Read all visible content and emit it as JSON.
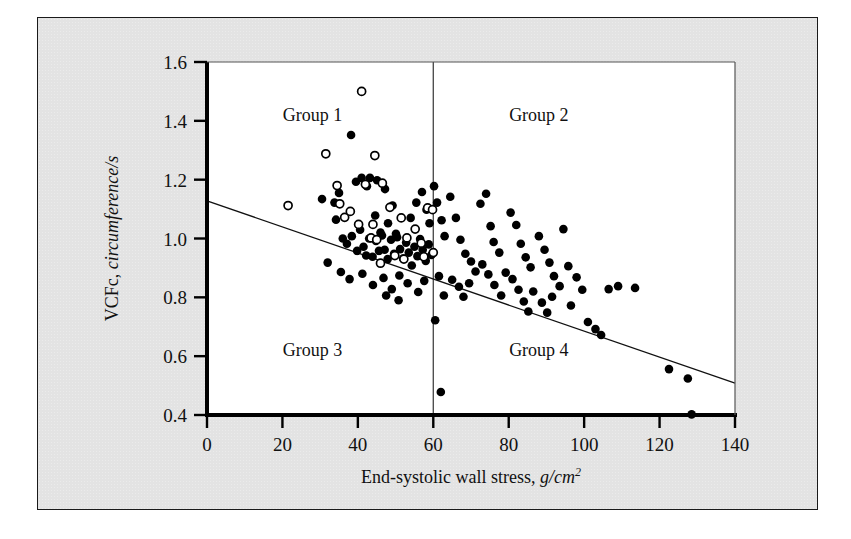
{
  "figure": {
    "background_color": "#e3e3e3",
    "plot_background_color": "#ffffff",
    "border_color": "#1a1a1a"
  },
  "chart_data": {
    "type": "scatter",
    "title": "",
    "xlabel": "End-systolic wall stress, g/cm",
    "xlabel_superscript": "2",
    "ylabel_roman": "VCFc, ",
    "ylabel_italic": "circumference/s",
    "xlim": [
      0,
      140
    ],
    "ylim": [
      0.4,
      1.6
    ],
    "xticks": [
      0,
      20,
      40,
      60,
      80,
      100,
      120,
      140
    ],
    "yticks": [
      0.4,
      0.6,
      0.8,
      1.0,
      1.2,
      1.4,
      1.6
    ],
    "xtick_labels": [
      "0",
      "20",
      "40",
      "60",
      "80",
      "100",
      "120",
      "140"
    ],
    "ytick_labels": [
      "0.4",
      "0.6",
      "0.8",
      "1.0",
      "1.2",
      "1.4",
      "1.6"
    ],
    "grid": false,
    "legend": false,
    "annotations": [
      {
        "text": "Group 1",
        "x": 28,
        "y": 1.4,
        "quadrant": "upper-left"
      },
      {
        "text": "Group 2",
        "x": 88,
        "y": 1.4,
        "quadrant": "upper-right"
      },
      {
        "text": "Group 3",
        "x": 28,
        "y": 0.6,
        "quadrant": "lower-left"
      },
      {
        "text": "Group 4",
        "x": 88,
        "y": 0.6,
        "quadrant": "lower-right"
      }
    ],
    "reference_lines": [
      {
        "name": "vertical-divider",
        "orientation": "vertical",
        "x": 60,
        "y_from": 0.4,
        "y_to": 1.6,
        "color": "#444444",
        "width": 1.3
      },
      {
        "name": "regression-line",
        "orientation": "diagonal",
        "x_from": 0,
        "y_from": 1.128,
        "x_to": 140,
        "y_to": 0.508,
        "color": "#111111",
        "width": 1.3
      }
    ],
    "series": [
      {
        "name": "filled-markers",
        "marker": "filled-circle",
        "color": "#000000",
        "points": [
          [
            30.5,
            1.134
          ],
          [
            33.8,
            1.122
          ],
          [
            35.0,
            1.155
          ],
          [
            38.2,
            1.352
          ],
          [
            39.5,
            1.193
          ],
          [
            41.0,
            1.206
          ],
          [
            42.4,
            1.178
          ],
          [
            43.2,
            1.206
          ],
          [
            44.6,
            1.078
          ],
          [
            45.1,
            1.198
          ],
          [
            46.0,
            1.02
          ],
          [
            47.2,
            1.168
          ],
          [
            48.0,
            1.052
          ],
          [
            49.2,
            1.112
          ],
          [
            50.1,
            1.016
          ],
          [
            34.2,
            1.064
          ],
          [
            36.0,
            1.0
          ],
          [
            37.1,
            0.982
          ],
          [
            38.4,
            1.008
          ],
          [
            39.8,
            0.958
          ],
          [
            40.6,
            1.03
          ],
          [
            41.5,
            0.972
          ],
          [
            42.2,
            0.942
          ],
          [
            43.0,
            1.0
          ],
          [
            43.9,
            0.938
          ],
          [
            44.8,
            0.992
          ],
          [
            45.6,
            0.958
          ],
          [
            46.4,
            1.01
          ],
          [
            47.1,
            0.962
          ],
          [
            47.9,
            0.93
          ],
          [
            48.8,
            0.996
          ],
          [
            49.6,
            0.948
          ],
          [
            50.4,
            1.004
          ],
          [
            51.2,
            0.964
          ],
          [
            52.0,
            0.932
          ],
          [
            52.8,
            0.986
          ],
          [
            53.5,
            0.952
          ],
          [
            54.3,
            0.908
          ],
          [
            55.0,
            0.972
          ],
          [
            55.8,
            0.94
          ],
          [
            56.5,
            0.998
          ],
          [
            57.2,
            0.962
          ],
          [
            58.0,
            0.924
          ],
          [
            58.8,
            0.98
          ],
          [
            59.5,
            0.944
          ],
          [
            32.0,
            0.918
          ],
          [
            35.5,
            0.886
          ],
          [
            37.8,
            0.862
          ],
          [
            41.2,
            0.88
          ],
          [
            44.0,
            0.842
          ],
          [
            46.8,
            0.866
          ],
          [
            49.0,
            0.828
          ],
          [
            51.0,
            0.874
          ],
          [
            53.2,
            0.848
          ],
          [
            56.0,
            0.818
          ],
          [
            57.6,
            0.856
          ],
          [
            54.0,
            1.07
          ],
          [
            55.5,
            1.122
          ],
          [
            57.0,
            1.158
          ],
          [
            58.2,
            1.098
          ],
          [
            59.0,
            1.052
          ],
          [
            60.2,
            1.178
          ],
          [
            61.0,
            1.122
          ],
          [
            62.2,
            1.062
          ],
          [
            63.0,
            1.008
          ],
          [
            61.5,
            0.872
          ],
          [
            62.8,
            0.806
          ],
          [
            60.5,
            0.722
          ],
          [
            62.0,
            0.478
          ],
          [
            64.5,
            1.142
          ],
          [
            66.0,
            1.07
          ],
          [
            67.2,
            0.996
          ],
          [
            68.5,
            0.948
          ],
          [
            70.0,
            0.922
          ],
          [
            71.2,
            0.888
          ],
          [
            65.0,
            0.86
          ],
          [
            66.8,
            0.836
          ],
          [
            68.0,
            0.802
          ],
          [
            69.5,
            0.848
          ],
          [
            72.5,
            1.118
          ],
          [
            74.0,
            1.152
          ],
          [
            75.2,
            1.042
          ],
          [
            76.0,
            0.988
          ],
          [
            77.5,
            0.952
          ],
          [
            73.0,
            0.912
          ],
          [
            74.6,
            0.878
          ],
          [
            76.2,
            0.842
          ],
          [
            78.0,
            0.806
          ],
          [
            79.2,
            0.884
          ],
          [
            80.5,
            1.088
          ],
          [
            82.0,
            1.046
          ],
          [
            83.2,
            0.982
          ],
          [
            84.5,
            0.936
          ],
          [
            85.8,
            0.902
          ],
          [
            81.0,
            0.862
          ],
          [
            82.6,
            0.826
          ],
          [
            84.0,
            0.786
          ],
          [
            85.2,
            0.752
          ],
          [
            86.5,
            0.82
          ],
          [
            88.0,
            1.008
          ],
          [
            89.5,
            0.962
          ],
          [
            90.8,
            0.918
          ],
          [
            92.0,
            0.872
          ],
          [
            93.5,
            0.838
          ],
          [
            88.8,
            0.782
          ],
          [
            90.2,
            0.748
          ],
          [
            91.5,
            0.802
          ],
          [
            94.5,
            1.032
          ],
          [
            95.8,
            0.906
          ],
          [
            96.5,
            0.772
          ],
          [
            98.0,
            0.868
          ],
          [
            99.5,
            0.826
          ],
          [
            101.0,
            0.716
          ],
          [
            103.0,
            0.692
          ],
          [
            104.5,
            0.672
          ],
          [
            106.5,
            0.828
          ],
          [
            109.0,
            0.838
          ],
          [
            113.5,
            0.832
          ],
          [
            122.5,
            0.556
          ],
          [
            127.5,
            0.524
          ],
          [
            128.5,
            0.402
          ],
          [
            50.8,
            0.79
          ],
          [
            47.5,
            0.806
          ]
        ]
      },
      {
        "name": "open-markers",
        "marker": "open-circle",
        "color": "#000000",
        "points": [
          [
            41.0,
            1.5
          ],
          [
            31.5,
            1.288
          ],
          [
            44.5,
            1.282
          ],
          [
            21.5,
            1.112
          ],
          [
            34.5,
            1.18
          ],
          [
            42.0,
            1.184
          ],
          [
            46.5,
            1.188
          ],
          [
            35.2,
            1.118
          ],
          [
            36.5,
            1.072
          ],
          [
            38.0,
            1.092
          ],
          [
            40.2,
            1.048
          ],
          [
            43.5,
            1.002
          ],
          [
            45.0,
            0.996
          ],
          [
            44.0,
            1.048
          ],
          [
            48.5,
            1.106
          ],
          [
            51.5,
            1.07
          ],
          [
            53.0,
            1.002
          ],
          [
            55.2,
            1.032
          ],
          [
            56.8,
            0.984
          ],
          [
            58.5,
            1.104
          ],
          [
            59.8,
            1.098
          ],
          [
            60.0,
            0.952
          ],
          [
            57.5,
            0.938
          ],
          [
            49.8,
            0.942
          ],
          [
            52.2,
            0.93
          ],
          [
            46.0,
            0.916
          ]
        ]
      }
    ]
  }
}
